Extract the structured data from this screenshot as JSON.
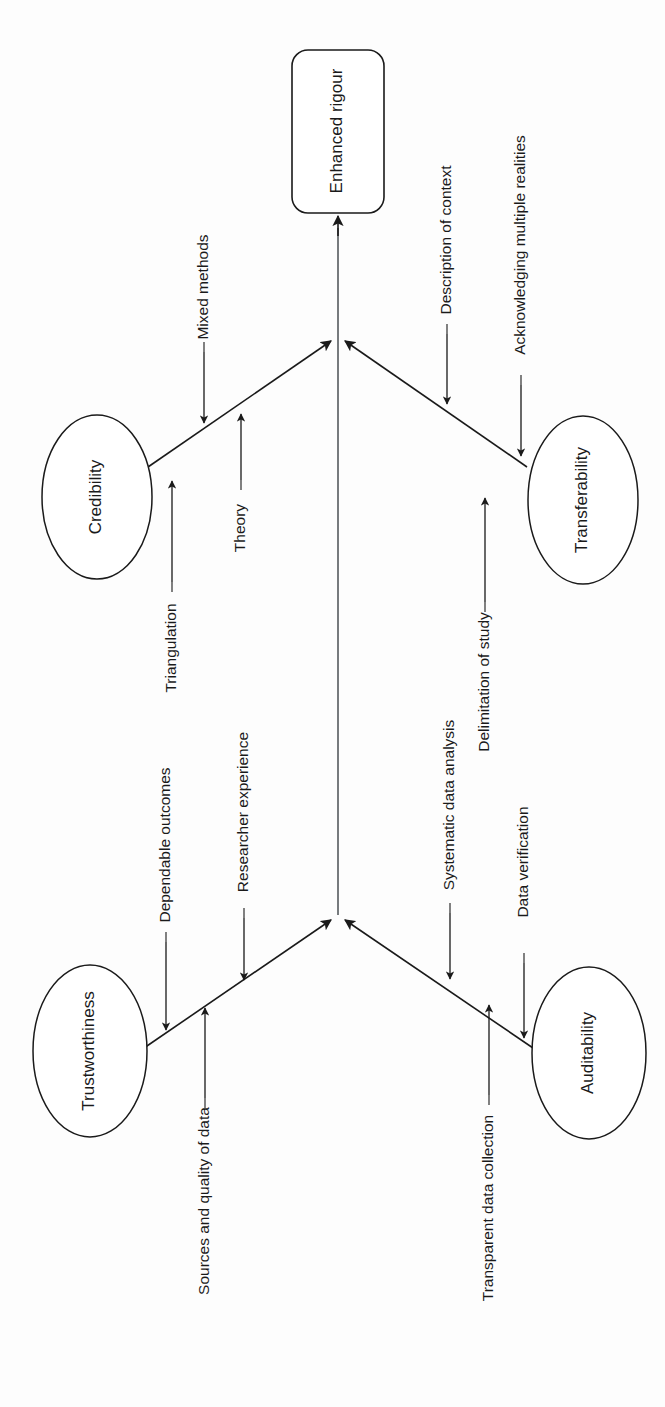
{
  "diagram": {
    "orientation": "rotated-90-counterclockwise",
    "central_node": {
      "label": "Enhanced rigour",
      "shape": "rounded-rectangle"
    },
    "concept_nodes": [
      {
        "id": "credibility",
        "label": "Credibility",
        "shape": "ellipse"
      },
      {
        "id": "transferability",
        "label": "Transferability",
        "shape": "ellipse"
      },
      {
        "id": "trustworthiness",
        "label": "Trustworthiness",
        "shape": "ellipse"
      },
      {
        "id": "auditability",
        "label": "Auditability",
        "shape": "ellipse"
      }
    ],
    "edge_labels": {
      "credibility_to_apex_upper": "Mixed methods",
      "credibility_to_apex_lower": "Theory",
      "credibility_edge_outer": "Triangulation",
      "transferability_upper": "Description of context",
      "transferability_outer": "Acknowledging multiple realities",
      "transferability_lower": "Delimitation of study",
      "trustworthiness_outer": "Dependable outcomes",
      "trustworthiness_upper": "Researcher experience",
      "trustworthiness_lower": "Sources and quality of data",
      "auditability_upper": "Systematic data analysis",
      "auditability_outer": "Data verification",
      "auditability_lower": "Transparent data collection"
    },
    "colors": {
      "stroke": "#1a1a1a",
      "fill": "#ffffff",
      "spine": "#555a5e",
      "background": "#fdfdfd"
    }
  }
}
